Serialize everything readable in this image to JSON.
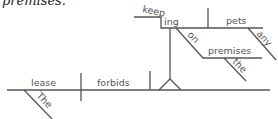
{
  "caption": "premises.",
  "diagram": {
    "subject": "lease",
    "subject_modifier": "The",
    "verb": "forbids",
    "gerund_object": {
      "word_stem": "keep",
      "word_suffix": "ing",
      "object": "pets",
      "object_modifier": "any",
      "preposition": "on",
      "prep_object": "premises",
      "prep_object_modifier": "the"
    }
  },
  "colors": {
    "line": "#555555",
    "text": "#555555"
  }
}
